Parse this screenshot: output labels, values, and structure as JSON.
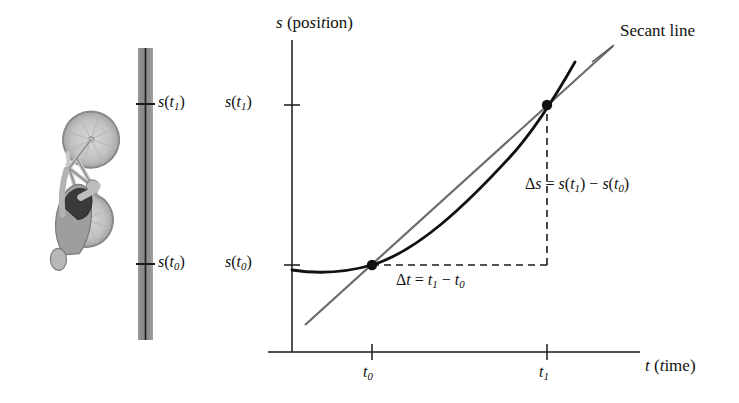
{
  "figure": {
    "background_color": "#ffffff",
    "ink_color": "#111111",
    "secant_color": "#6b6b6b",
    "track_color": "#8c8c8c"
  },
  "axes": {
    "y_label": "s (position)",
    "x_label": "t (time)",
    "y_tick_labels": [
      "s(t₁)",
      "s(t₀)"
    ],
    "x_tick_labels": [
      "t₀",
      "t₁"
    ]
  },
  "track": {
    "name": "vertical road strip",
    "tick_labels": [
      "s(t₁)",
      "s(t₀)"
    ]
  },
  "annotations": {
    "secant_line": "Secant line",
    "delta_t": "Δt = t₁ − t₀",
    "delta_s": "Δs = s(t₁) − s(t₀)"
  },
  "chart_data": {
    "type": "line",
    "title": "",
    "xlabel": "t (time)",
    "ylabel": "s (position)",
    "grid": false,
    "legend": "none",
    "axis_origin_px": [
      292,
      352
    ],
    "xlim_px": [
      292,
      640
    ],
    "ylim_px": [
      352,
      40
    ],
    "x_ticks": [
      {
        "label": "t₀",
        "x_px": 372
      },
      {
        "label": "t₁",
        "x_px": 547
      }
    ],
    "y_ticks": [
      {
        "label": "s(t₁)",
        "y_px": 105
      },
      {
        "label": "s(t₀)",
        "y_px": 265
      }
    ],
    "series": [
      {
        "name": "position curve s(t)",
        "style": "solid",
        "color": "#111111",
        "width_px": 2.6,
        "points_px": [
          [
            292,
            270
          ],
          [
            310,
            272
          ],
          [
            330,
            272
          ],
          [
            350,
            270
          ],
          [
            372,
            265
          ],
          [
            400,
            252
          ],
          [
            430,
            232
          ],
          [
            460,
            206
          ],
          [
            490,
            176
          ],
          [
            520,
            142
          ],
          [
            547,
            105
          ],
          [
            575,
            62
          ]
        ]
      },
      {
        "name": "secant line through (t0, s(t0)) and (t1, s(t1))",
        "style": "solid",
        "color": "#6b6b6b",
        "width_px": 2.2,
        "points_px": [
          [
            305,
            325
          ],
          [
            372,
            265
          ],
          [
            547,
            105
          ],
          [
            613,
            46
          ]
        ]
      }
    ],
    "marked_points": [
      {
        "label": "(t₀, s(t₀))",
        "x_px": 372,
        "y_px": 265
      },
      {
        "label": "(t₁, s(t₁))",
        "x_px": 547,
        "y_px": 105
      }
    ],
    "dashed_guides": [
      {
        "name": "delta-t horizontal leg",
        "from_px": [
          372,
          265
        ],
        "to_px": [
          547,
          265
        ]
      },
      {
        "name": "delta-s vertical leg",
        "from_px": [
          547,
          265
        ],
        "to_px": [
          547,
          105
        ]
      }
    ],
    "annotations": [
      {
        "text": "Secant line",
        "x_px": 620,
        "y_px": 30
      },
      {
        "text": "Δt = t₁ − t₀",
        "x_px": 396,
        "y_px": 280
      },
      {
        "text": "Δs = s(t₁) − s(t₀)",
        "x_px": 525,
        "y_px": 184
      }
    ]
  }
}
